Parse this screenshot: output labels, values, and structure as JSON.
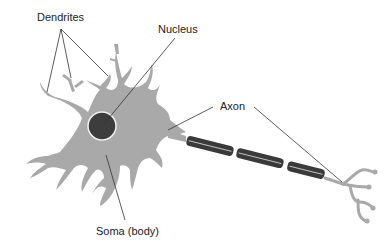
{
  "diagram": {
    "labels": {
      "dendrites": "Dendrites",
      "nucleus": "Nucleus",
      "axon": "Axon",
      "soma": "Soma (body)"
    },
    "colors": {
      "cell_body": "#a9a9a9",
      "nucleus": "#3d3d3d",
      "myelin": "#3a3a3a",
      "myelin_stripe": "#d8d8d8",
      "leader_line": "#333333",
      "text": "#222222",
      "background": "#ffffff"
    }
  }
}
